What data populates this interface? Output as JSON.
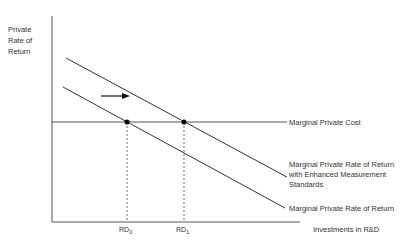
{
  "diagram": {
    "y_axis_label": "Private Rate of Return",
    "x_axis_label": "Investments in R&D",
    "curves": {
      "mpc": "Marginal Private Cost",
      "mprr_enhanced": "Marginal Private Rate of Return with Enhanced Measurement Standards",
      "mprr": "Marginal Private Rate of Return"
    },
    "ticks": {
      "rd0_base": "RD",
      "rd0_sub": "0",
      "rd1_base": "RD",
      "rd1_sub": "1"
    },
    "shift_arrow": "right-arrow"
  },
  "colors": {
    "line": "#333333",
    "axis": "#555555",
    "dot": "#000000"
  }
}
